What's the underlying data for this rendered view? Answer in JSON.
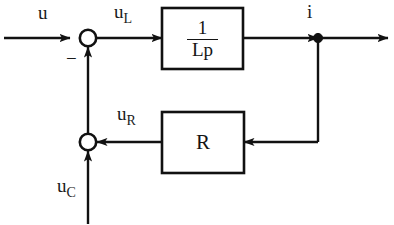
{
  "diagram": {
    "type": "control-block-diagram",
    "stroke_color": "#111111",
    "background_color": "#ffffff",
    "blocks": [
      {
        "name": "inductor-block",
        "label_numerator": "1",
        "label_denominator": "Lp",
        "x": 162,
        "y": 8,
        "width": 81,
        "height": 61
      },
      {
        "name": "resistor-block",
        "label": "R",
        "x": 162,
        "y": 112,
        "width": 82,
        "height": 61
      }
    ],
    "summing_junctions": [
      {
        "name": "upper-sum",
        "cx": 88,
        "cy": 38,
        "r": 8,
        "sign": "−"
      },
      {
        "name": "lower-sum",
        "cx": 88,
        "cy": 142,
        "r": 8,
        "sign": ""
      }
    ],
    "node": {
      "name": "current-node",
      "cx": 318,
      "cy": 38,
      "r": 4
    },
    "signals": {
      "input": {
        "base": "u",
        "sub": ""
      },
      "inductor_voltage": {
        "base": "u",
        "sub": "L"
      },
      "resistor_voltage": {
        "base": "u",
        "sub": "R"
      },
      "capacitor_voltage": {
        "base": "u",
        "sub": "C"
      },
      "current": {
        "base": "i",
        "sub": ""
      }
    },
    "minus_label": "−"
  }
}
